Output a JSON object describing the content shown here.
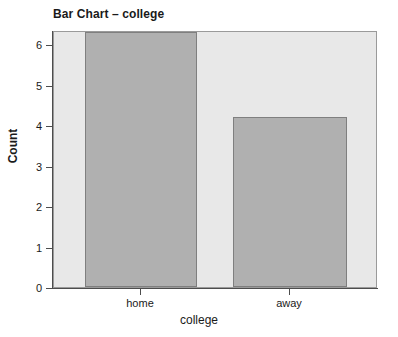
{
  "chart_data": {
    "type": "bar",
    "title": "Bar Chart – college",
    "xlabel": "college",
    "ylabel": "Count",
    "categories": [
      "home",
      "away"
    ],
    "values": [
      6,
      4
    ],
    "ylim": [
      0,
      6
    ],
    "ytick_labels": [
      "0",
      "1",
      "2",
      "3",
      "4",
      "5",
      "6"
    ],
    "ytick_values": [
      0,
      1,
      2,
      3,
      4,
      5,
      6
    ],
    "grid": false,
    "legend": false,
    "legend_position": "none",
    "bar_fill_color": "#b0b0b0",
    "bar_border_color": "#7f7f7f",
    "panel_background_color": "#e8e8e8",
    "panel_border_color": "#9a9a9a",
    "page_background_color": "#ffffff",
    "axis_color": "#4d4d4d",
    "text_color": "#1a1a1a"
  }
}
